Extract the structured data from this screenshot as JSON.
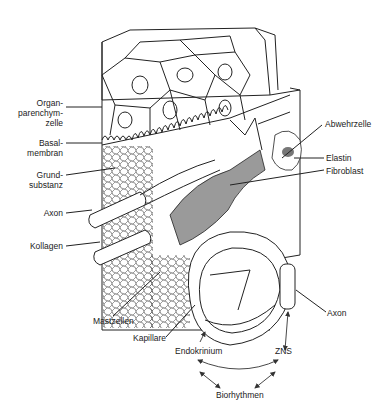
{
  "diagram": {
    "labels_left": {
      "organ_1": "Organ-",
      "organ_2": "parenchym-",
      "organ_3": "zelle",
      "basal_1": "Basal-",
      "basal_2": "membran",
      "grund_1": "Grund-",
      "grund_2": "substanz",
      "axon": "Axon",
      "kollagen": "Kollagen"
    },
    "labels_right": {
      "abwehrzelle": "Abwehrzelle",
      "elastin": "Elastin",
      "fibroblast": "Fibroblast",
      "axon": "Axon"
    },
    "labels_bottom": {
      "mastzellen": "Mastzellen",
      "kapillare": "Kapillare",
      "endokrinium": "Endokrinium",
      "zns": "ZNS",
      "biorhythmen": "Biorhythmen"
    },
    "colors": {
      "line": "#222222",
      "fill_gray": "#9a9a9a",
      "background": "#ffffff"
    }
  }
}
